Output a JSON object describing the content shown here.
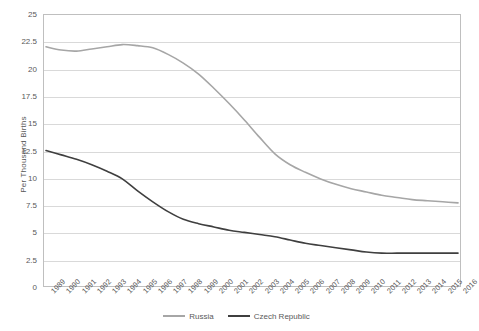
{
  "chart_data": {
    "type": "line",
    "title": "",
    "xlabel": "",
    "ylabel": "Per Thousand Births",
    "ylim": [
      0,
      25
    ],
    "ytick_step": 2.5,
    "grid": true,
    "legend_position": "bottom",
    "categories": [
      "1989",
      "1990",
      "1991",
      "1992",
      "1993",
      "1994",
      "1995",
      "1996",
      "1997",
      "1998",
      "1999",
      "2000",
      "2001",
      "2002",
      "2003",
      "2004",
      "2005",
      "2006",
      "2007",
      "2008",
      "2009",
      "2010",
      "2011",
      "2012",
      "2013",
      "2014",
      "2015",
      "2016"
    ],
    "series": [
      {
        "name": "Russia",
        "color": "#a6a6a6",
        "values": [
          22.0,
          21.7,
          21.6,
          21.8,
          22.0,
          22.2,
          22.1,
          21.9,
          21.3,
          20.5,
          19.5,
          18.2,
          16.8,
          15.3,
          13.7,
          12.2,
          11.2,
          10.5,
          9.9,
          9.4,
          9.0,
          8.7,
          8.4,
          8.2,
          8.0,
          7.9,
          7.8,
          7.7
        ]
      },
      {
        "name": "Czech Republic",
        "color": "#3f3f3f",
        "values": [
          12.5,
          12.1,
          11.7,
          11.2,
          10.6,
          9.9,
          8.8,
          7.8,
          6.9,
          6.2,
          5.8,
          5.5,
          5.2,
          5.0,
          4.8,
          4.6,
          4.3,
          4.0,
          3.8,
          3.6,
          3.4,
          3.2,
          3.1,
          3.1,
          3.1,
          3.1,
          3.1,
          3.1
        ]
      }
    ]
  }
}
